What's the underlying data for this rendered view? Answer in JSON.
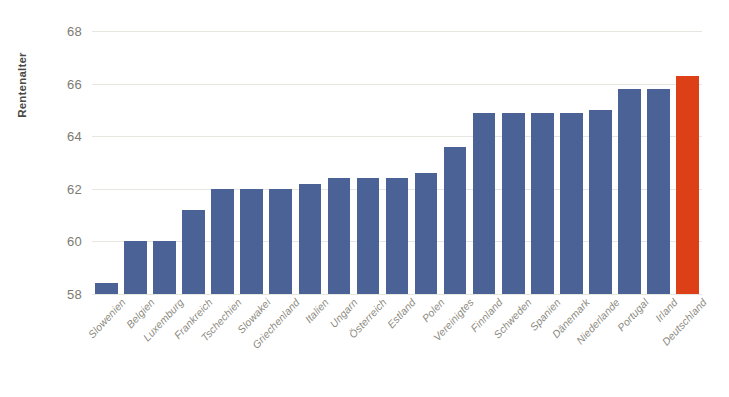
{
  "chart_data": {
    "type": "bar",
    "title": "",
    "xlabel": "",
    "ylabel": "Rentenalter",
    "ylim": [
      58,
      68
    ],
    "yticks": [
      58,
      60,
      62,
      64,
      66,
      68
    ],
    "ytick_labels": [
      "58",
      "60",
      "62",
      "64",
      "66",
      "68"
    ],
    "grid": true,
    "legend": "none",
    "categories": [
      "Slowenien",
      "Belgien",
      "Luxemburg",
      "Frankreich",
      "Tschechien",
      "Slowakei",
      "Griechenland",
      "Italien",
      "Ungarn",
      "Österreich",
      "Estland",
      "Polen",
      "Vereinigtes",
      "Finnland",
      "Schweden",
      "Spanien",
      "Dänemark",
      "Niederlande",
      "Portugal",
      "Irland",
      "Deutschland"
    ],
    "values": [
      58.4,
      60.0,
      60.0,
      61.2,
      62.0,
      62.0,
      62.0,
      62.2,
      62.4,
      62.4,
      62.4,
      62.6,
      63.6,
      64.9,
      64.9,
      64.9,
      64.9,
      65.0,
      65.8,
      65.8,
      66.3
    ],
    "bar_colors": [
      "#4a6296",
      "#4a6296",
      "#4a6296",
      "#4a6296",
      "#4a6296",
      "#4a6296",
      "#4a6296",
      "#4a6296",
      "#4a6296",
      "#4a6296",
      "#4a6296",
      "#4a6296",
      "#4a6296",
      "#4a6296",
      "#4a6296",
      "#4a6296",
      "#4a6296",
      "#4a6296",
      "#4a6296",
      "#4a6296",
      "#dd4016"
    ],
    "colors": {
      "bar_default": "#4a6296",
      "bar_highlight": "#dd4016",
      "gridline": "#e8e6e0",
      "tick_text": "#7b7b72",
      "axis_title": "#4a4a44",
      "background": "#ffffff"
    }
  }
}
